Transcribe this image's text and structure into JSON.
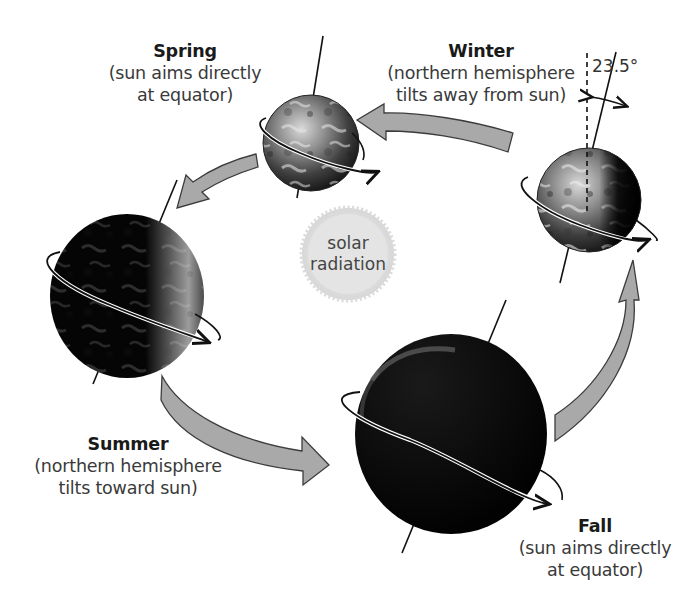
{
  "diagram": {
    "colors": {
      "arrow_fill": "#a9a9a9",
      "arrow_stroke": "#3c3c3c",
      "sun_fill": "#e6e6e6",
      "globe_dark": "#050505",
      "globe_light": "#9a9a9a",
      "axis_line": "#111111"
    },
    "sun": {
      "line1": "solar",
      "line2": "radiation"
    },
    "tilt_angle": "23.5°",
    "seasons": [
      {
        "id": "spring",
        "title": "Spring",
        "desc_line1": "(sun aims directly",
        "desc_line2": "at equator)"
      },
      {
        "id": "winter",
        "title": "Winter",
        "desc_line1": "(northern hemisphere",
        "desc_line2": "tilts away from sun)"
      },
      {
        "id": "summer",
        "title": "Summer",
        "desc_line1": "(northern hemisphere",
        "desc_line2": "tilts toward sun)"
      },
      {
        "id": "fall",
        "title": "Fall",
        "desc_line1": "(sun aims directly",
        "desc_line2": "at equator)"
      }
    ],
    "icons": [
      "globe-spring",
      "globe-winter",
      "globe-summer",
      "globe-fall",
      "orbit-arrow",
      "rotation-arrow",
      "sun-icon",
      "angle-arrow"
    ]
  }
}
